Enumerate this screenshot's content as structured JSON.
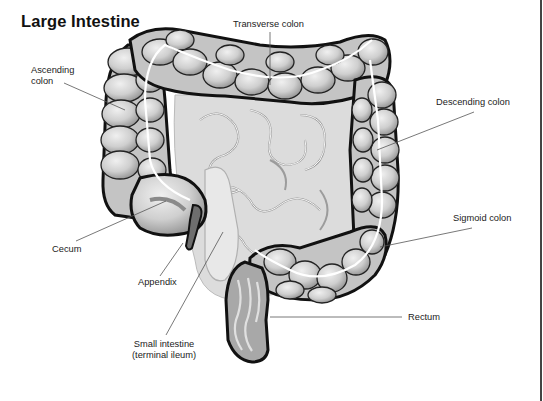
{
  "title": "Large Intestine",
  "labels": {
    "transverse_colon": "Transverse colon",
    "ascending_colon_line1": "Ascending",
    "ascending_colon_line2": "colon",
    "descending_colon": "Descending colon",
    "cecum": "Cecum",
    "sigmoid_colon": "Sigmoid colon",
    "appendix": "Appendix",
    "rectum": "Rectum",
    "small_intestine_line1": "Small intestine",
    "small_intestine_line2": "(terminal ileum)"
  },
  "colors": {
    "outline": "#111111",
    "colon_fill": "#c8c8c8",
    "colon_highlight": "#e6e6e6",
    "small_intestine_fill": "#dedede",
    "leader_line": "#555555"
  }
}
